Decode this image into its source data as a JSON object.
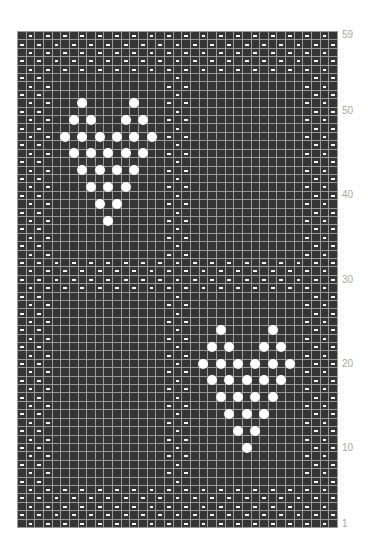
{
  "chart_title": "",
  "grid": {
    "columns": 37,
    "rows": 59,
    "colors": {
      "cell": "#353535",
      "grid_line": "#9a9a9a",
      "purl_mark": "#f4f4f4",
      "bobble": "#ffffff",
      "label": "#a8a8a8"
    },
    "symbols": {
      "empty": "knit (dark square)",
      "purl": "white dash",
      "bobble": "white circle"
    },
    "seed_regions": {
      "border_columns": [
        [
          1,
          4
        ],
        [
          34,
          37
        ]
      ],
      "border_rows": [
        [
          1,
          5
        ],
        [
          55,
          59
        ]
      ],
      "middle_band_rows": [
        [
          29,
          32
        ]
      ],
      "center_columns": [
        [
          18,
          20
        ]
      ]
    },
    "bobbles": [
      [
        51,
        8
      ],
      [
        51,
        14
      ],
      [
        49,
        7
      ],
      [
        49,
        9
      ],
      [
        49,
        13
      ],
      [
        49,
        15
      ],
      [
        47,
        6
      ],
      [
        47,
        8
      ],
      [
        47,
        10
      ],
      [
        47,
        12
      ],
      [
        47,
        14
      ],
      [
        47,
        16
      ],
      [
        45,
        7
      ],
      [
        45,
        9
      ],
      [
        45,
        11
      ],
      [
        45,
        13
      ],
      [
        45,
        15
      ],
      [
        43,
        8
      ],
      [
        43,
        10
      ],
      [
        43,
        12
      ],
      [
        43,
        14
      ],
      [
        41,
        9
      ],
      [
        41,
        11
      ],
      [
        41,
        13
      ],
      [
        39,
        10
      ],
      [
        39,
        12
      ],
      [
        37,
        11
      ],
      [
        24,
        24
      ],
      [
        24,
        30
      ],
      [
        22,
        23
      ],
      [
        22,
        25
      ],
      [
        22,
        29
      ],
      [
        22,
        31
      ],
      [
        20,
        22
      ],
      [
        20,
        24
      ],
      [
        20,
        26
      ],
      [
        20,
        28
      ],
      [
        20,
        30
      ],
      [
        20,
        32
      ],
      [
        18,
        23
      ],
      [
        18,
        25
      ],
      [
        18,
        27
      ],
      [
        18,
        29
      ],
      [
        18,
        31
      ],
      [
        16,
        24
      ],
      [
        16,
        26
      ],
      [
        16,
        28
      ],
      [
        16,
        30
      ],
      [
        14,
        25
      ],
      [
        14,
        27
      ],
      [
        14,
        29
      ],
      [
        12,
        26
      ],
      [
        12,
        28
      ],
      [
        10,
        27
      ]
    ]
  },
  "row_labels": [
    {
      "text": "59",
      "row": 59
    },
    {
      "text": "50",
      "row": 50
    },
    {
      "text": "40",
      "row": 40
    },
    {
      "text": "30",
      "row": 30
    },
    {
      "text": "20",
      "row": 20
    },
    {
      "text": "10",
      "row": 10
    },
    {
      "text": "1",
      "row": 1
    }
  ]
}
